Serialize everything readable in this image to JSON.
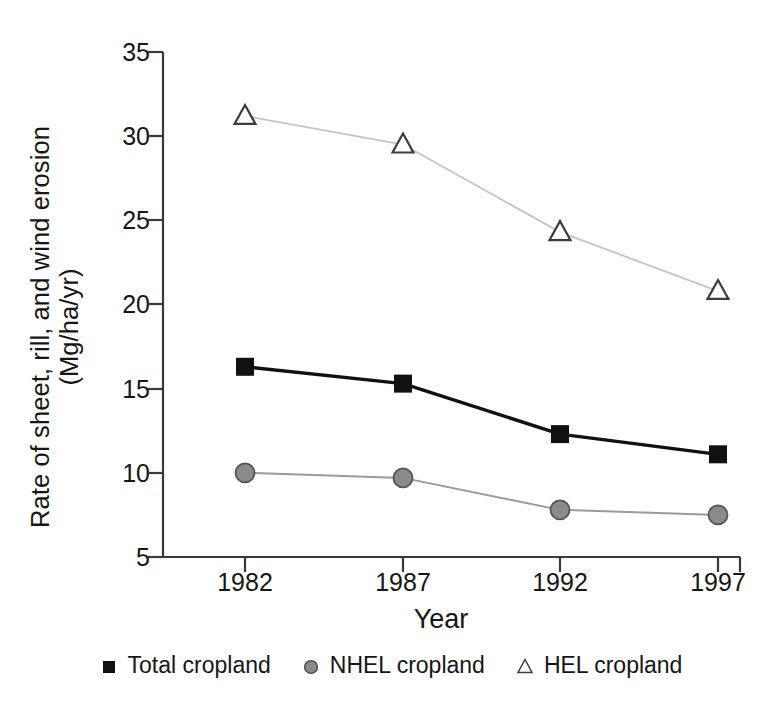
{
  "chart_data": {
    "type": "line",
    "title": "",
    "xlabel": "Year",
    "ylabel_line1": "Rate of sheet, rill, and wind erosion",
    "ylabel_line2": "(Mg/ha/yr)",
    "categories": [
      "1982",
      "1987",
      "1992",
      "1997"
    ],
    "x": [
      1982,
      1987,
      1992,
      1997
    ],
    "xlim": [
      1980.5,
      1998.5
    ],
    "ylim": [
      5,
      35
    ],
    "yticks": [
      35,
      30,
      25,
      20,
      15,
      10,
      5
    ],
    "xticks": [
      "1982",
      "1987",
      "1992",
      "1997"
    ],
    "grid": false,
    "legend_position": "bottom",
    "series": [
      {
        "name": "Total cropland",
        "values": [
          16.3,
          15.3,
          12.3,
          11.1
        ],
        "marker": "square",
        "marker_color": "#111111",
        "line_color": "#111111",
        "line_width": 3.4
      },
      {
        "name": "NHEL cropland",
        "values": [
          10.0,
          9.7,
          7.8,
          7.5
        ],
        "marker": "circle",
        "marker_color": "#8a8a8a",
        "line_color": "#9b9b9b",
        "line_width": 2.0
      },
      {
        "name": "HEL cropland",
        "values": [
          31.2,
          29.5,
          24.3,
          20.8
        ],
        "marker": "triangle",
        "marker_color": "#ffffff",
        "marker_edge_color": "#3c3c3c",
        "line_color": "#c4c4c4",
        "line_width": 1.8
      }
    ]
  },
  "axis": {
    "yticks": [
      {
        "label": "35"
      },
      {
        "label": "30"
      },
      {
        "label": "25"
      },
      {
        "label": "20"
      },
      {
        "label": "15"
      },
      {
        "label": "10"
      },
      {
        "label": "5"
      }
    ],
    "xticks": [
      {
        "label": "1982"
      },
      {
        "label": "1987"
      },
      {
        "label": "1992"
      },
      {
        "label": "1997"
      }
    ],
    "axis_color": "#3a3a3a"
  },
  "labels": {
    "ylabel_line1": "Rate of sheet, rill, and wind erosion",
    "ylabel_line2": "(Mg/ha/yr)",
    "xlabel": "Year"
  },
  "legend": {
    "items": [
      {
        "label": "Total cropland",
        "marker": "square-marker"
      },
      {
        "label": "NHEL cropland",
        "marker": "circle-marker"
      },
      {
        "label": "HEL cropland",
        "marker": "triangle-marker"
      }
    ]
  }
}
